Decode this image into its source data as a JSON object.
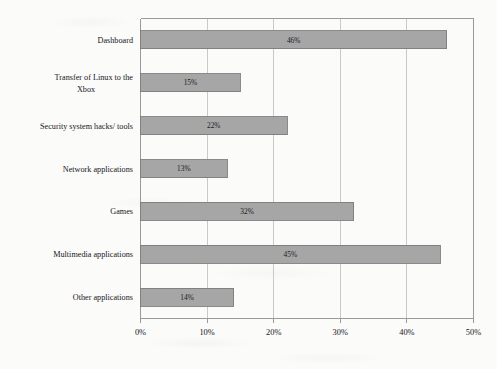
{
  "chart_data": {
    "type": "bar",
    "orientation": "horizontal",
    "title": "",
    "xlabel": "",
    "ylabel": "",
    "categories": [
      "Dashboard",
      "Transfer of Linux to the Xbox",
      "Security system hacks/ tools",
      "Network applications",
      "Games",
      "Multimedia applications",
      "Other applications"
    ],
    "values": [
      46,
      15,
      22,
      13,
      32,
      45,
      14
    ],
    "data_labels": [
      "46%",
      "15%",
      "22%",
      "13%",
      "32%",
      "45%",
      "14%"
    ],
    "xlim": [
      0,
      50
    ],
    "xtick_values": [
      0,
      10,
      20,
      30,
      40,
      50
    ],
    "xtick_labels": [
      "0%",
      "10%",
      "20%",
      "30%",
      "40%",
      "50%"
    ],
    "grid": "vertical",
    "legend": "none",
    "bar_fill": "#a6a6a6",
    "bar_stroke": "#7d7d7d",
    "axis_color": "#9a9a9a",
    "text_color": "#16161a"
  },
  "label_lines": [
    [
      "Dashboard"
    ],
    [
      "Transfer of Linux to the",
      "Xbox"
    ],
    [
      "Security system hacks/ tools"
    ],
    [
      "Network applications"
    ],
    [
      "Games"
    ],
    [
      "Multimedia applications"
    ],
    [
      "Other applications"
    ]
  ]
}
